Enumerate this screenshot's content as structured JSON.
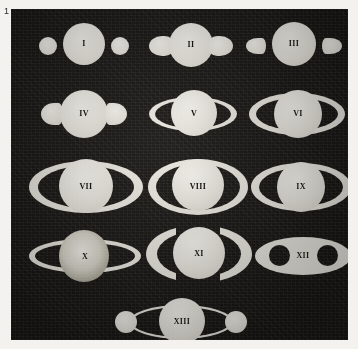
{
  "plate": {
    "number": "1",
    "background_color": "#171512",
    "ink_color": "#e9e7df",
    "paper_color": "#f4f2ee",
    "caption_color": "#2a2a2a"
  },
  "figures": [
    {
      "id": "fig-1",
      "label": "I",
      "row": 1,
      "col": 1,
      "description": "globe with two detached round ansae"
    },
    {
      "id": "fig-2",
      "label": "II",
      "row": 1,
      "col": 2,
      "description": "globe with two attached rounded ansae"
    },
    {
      "id": "fig-3",
      "label": "III",
      "row": 1,
      "col": 3,
      "description": "globe with two detached pointed ansae"
    },
    {
      "id": "fig-4",
      "label": "IV",
      "row": 2,
      "col": 1,
      "description": "globe with two short attached ansae"
    },
    {
      "id": "fig-5",
      "label": "V",
      "row": 2,
      "col": 2,
      "description": "globe with two narrow crescent ansae"
    },
    {
      "id": "fig-6",
      "label": "VI",
      "row": 2,
      "col": 3,
      "description": "globe with wider crescent ansae"
    },
    {
      "id": "fig-7",
      "label": "VII",
      "row": 3,
      "col": 1,
      "description": "globe with broad open ring crescents"
    },
    {
      "id": "fig-8",
      "label": "VIII",
      "row": 3,
      "col": 2,
      "description": "globe with tall narrow ring crescents"
    },
    {
      "id": "fig-9",
      "label": "IX",
      "row": 3,
      "col": 3,
      "description": "globe with asymmetric ring crescents"
    },
    {
      "id": "fig-10",
      "label": "X",
      "row": 4,
      "col": 1,
      "description": "shaded globe within thin open ellipse ring"
    },
    {
      "id": "fig-11",
      "label": "XI",
      "row": 4,
      "col": 2,
      "description": "globe flanked by thick separated ring arcs"
    },
    {
      "id": "fig-12",
      "label": "XII",
      "row": 4,
      "col": 3,
      "description": "solid ellipse pierced by two dark circles"
    },
    {
      "id": "fig-13",
      "label": "XIII",
      "row": 5,
      "col": 2,
      "description": "globe with lens-shaped ring and two terminal globes"
    }
  ]
}
